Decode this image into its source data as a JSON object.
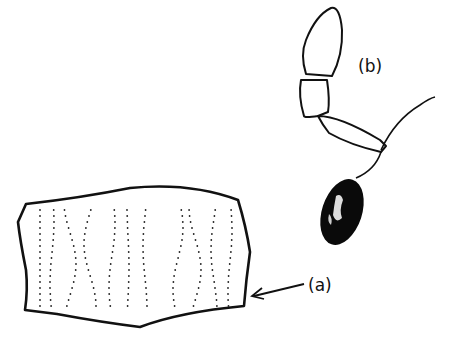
{
  "figure": {
    "labels": {
      "a": "(a)",
      "b": "(b)"
    },
    "colors": {
      "ink": "#111111",
      "background": "#ffffff"
    }
  }
}
